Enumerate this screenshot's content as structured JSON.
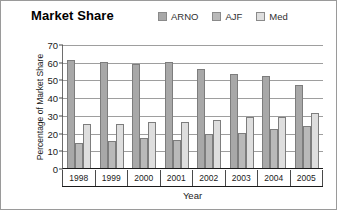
{
  "chart_data": {
    "type": "bar",
    "title": "Market Share",
    "xlabel": "Year",
    "ylabel": "Percentage of Market Share",
    "categories": [
      "1998",
      "1999",
      "2000",
      "2001",
      "2002",
      "2003",
      "2004",
      "2005"
    ],
    "series": [
      {
        "name": "ARNO",
        "color": "#a8a8a8",
        "values": [
          61,
          60,
          59,
          60,
          56,
          53,
          52,
          47
        ]
      },
      {
        "name": "AJF",
        "color": "#b9b9b9",
        "values": [
          14,
          15,
          17,
          16,
          19,
          20,
          22,
          24
        ]
      },
      {
        "name": "Med",
        "color": "#dedede",
        "values": [
          25,
          25,
          26,
          26,
          27,
          29,
          29,
          31
        ]
      }
    ],
    "ylim": [
      0,
      70
    ],
    "yticks": [
      0,
      10,
      20,
      30,
      40,
      50,
      60,
      70
    ],
    "grid": true,
    "legend_position": "top-right"
  }
}
